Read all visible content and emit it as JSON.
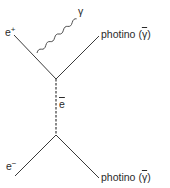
{
  "diagram": {
    "type": "feynman",
    "line_color": "#3a3a3a",
    "particles": {
      "positron": {
        "symbol": "e",
        "charge": "+"
      },
      "electron": {
        "symbol": "e",
        "charge": "−"
      },
      "photon": {
        "symbol": "γ"
      },
      "selectron": {
        "symbol": "e",
        "note": "overline (superpartner)"
      },
      "photino_top": {
        "name": "photino",
        "open": "(",
        "symbol": "γ",
        "close": ")"
      },
      "photino_bottom": {
        "name": "photino",
        "open": "(",
        "symbol": "γ",
        "close": ")"
      }
    }
  }
}
